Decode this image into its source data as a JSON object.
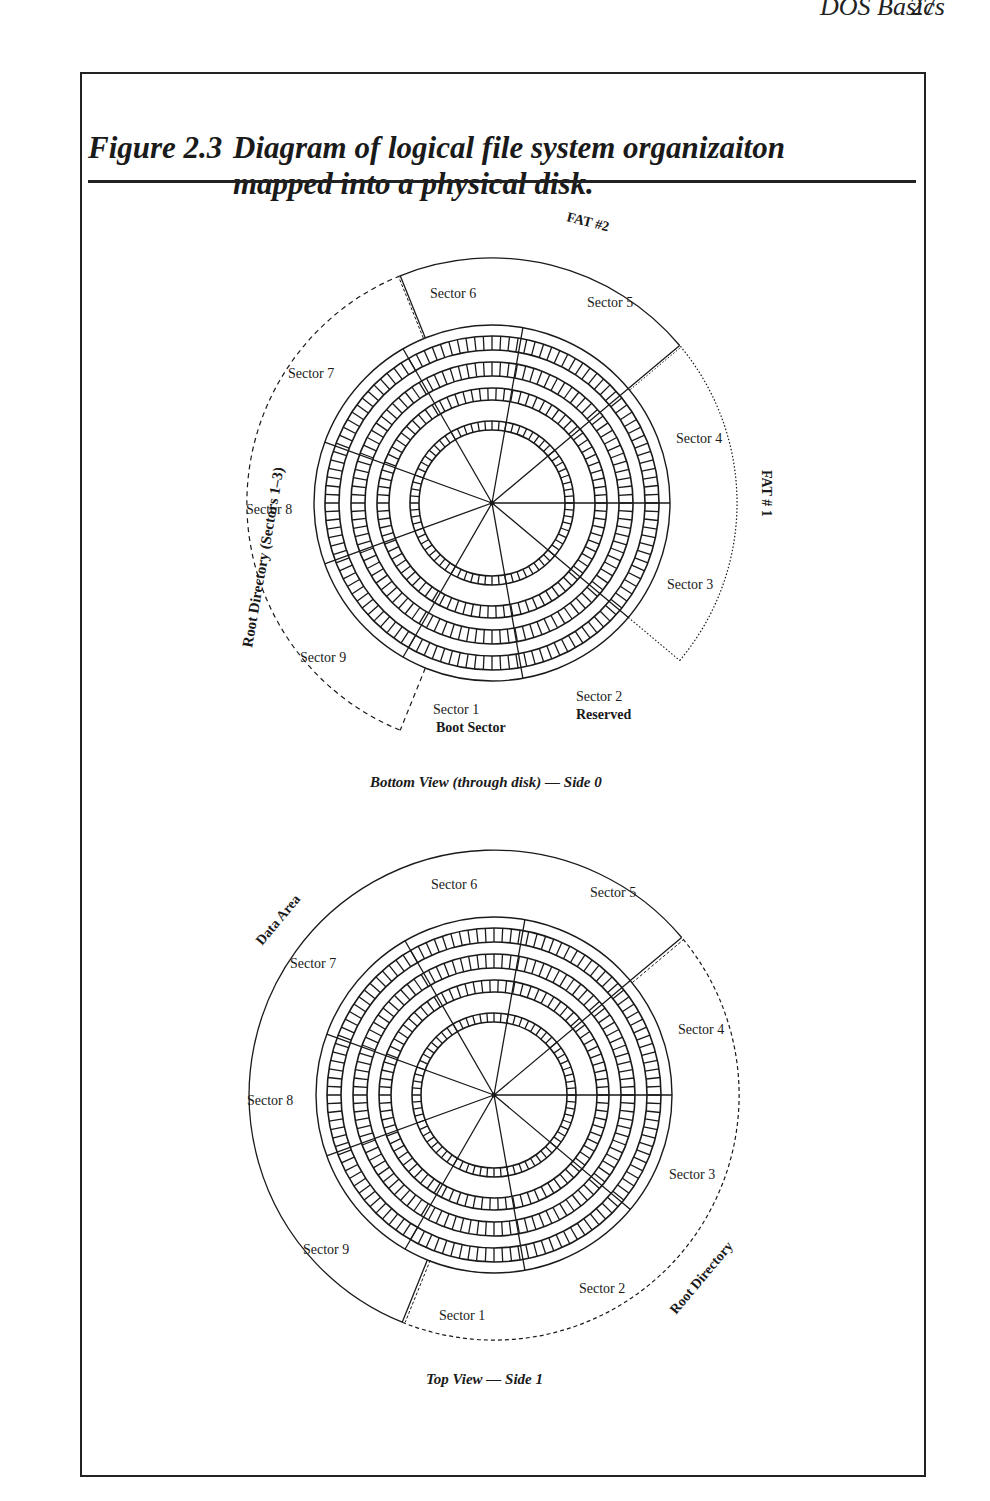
{
  "page": {
    "running_head": "DOS Basics",
    "page_number": "27"
  },
  "figure": {
    "label": "Figure 2.3",
    "title_line1": "Diagram of logical file system organizaiton",
    "title_line2": "mapped into a physical disk."
  },
  "bottom_view": {
    "caption": "Bottom View (through disk) — Side 0",
    "region_labels": {
      "fat2": "FAT #2",
      "fat1": "FAT # 1",
      "root_dir": "Root Directory (Sectors 1–3)"
    },
    "sectors": [
      {
        "label": "Sector 1",
        "sublabel": "Boot Sector"
      },
      {
        "label": "Sector 2",
        "sublabel": "Reserved"
      },
      {
        "label": "Sector 3"
      },
      {
        "label": "Sector 4"
      },
      {
        "label": "Sector 5"
      },
      {
        "label": "Sector 6"
      },
      {
        "label": "Sector 7"
      },
      {
        "label": "Sector 8"
      },
      {
        "label": "Sector 9"
      }
    ]
  },
  "top_view": {
    "caption": "Top View — Side 1",
    "region_labels": {
      "data_area": "Data Area",
      "root_dir": "Root Directory"
    },
    "sectors": [
      {
        "label": "Sector 1"
      },
      {
        "label": "Sector 2"
      },
      {
        "label": "Sector 3"
      },
      {
        "label": "Sector 4"
      },
      {
        "label": "Sector 5"
      },
      {
        "label": "Sector 6"
      },
      {
        "label": "Sector 7"
      },
      {
        "label": "Sector 8"
      },
      {
        "label": "Sector 9"
      }
    ]
  },
  "colors": {
    "ink": "#1a1a1a",
    "paper": "#ffffff"
  }
}
